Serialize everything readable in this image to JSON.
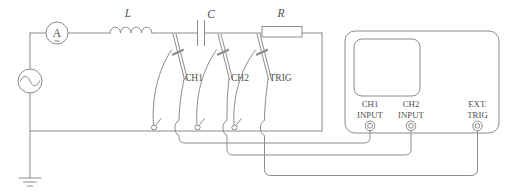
{
  "labels": {
    "ammeter": "A",
    "ammeter_wave": "~",
    "inductor": "L",
    "capacitor": "C",
    "resistor": "R"
  },
  "probes": {
    "ch1": "CH1",
    "ch2": "CH2",
    "trig": "TRIG"
  },
  "oscilloscope": {
    "inputs": [
      {
        "line1": "CH1",
        "line2": "INPUT"
      },
      {
        "line1": "CH2",
        "line2": "INPUT"
      },
      {
        "line1": "EXT.",
        "line2": "TRIG"
      }
    ]
  },
  "colors": {
    "line": "#8c8c8c",
    "text": "#4f4f4f",
    "bg": "#ffffff"
  }
}
